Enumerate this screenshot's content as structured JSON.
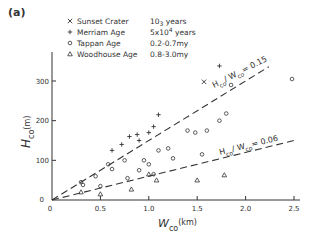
{
  "panel_label": "(a)",
  "legend": [
    {
      "symbol": "×",
      "name": "Sunset Crater",
      "age": "10",
      "age_sup": "3",
      "age_unit": "years"
    },
    {
      "symbol": "+",
      "name": "Merriam Age",
      "age": "5x10",
      "age_sup": "4",
      "age_unit": "years"
    },
    {
      "symbol": "○",
      "name": "Tappan Age",
      "age": "0.2-0.7my",
      "age_sup": "",
      "age_unit": ""
    },
    {
      "symbol": "△",
      "name": "Woodhouse Age",
      "age": "0.8-3.0my",
      "age_sup": "",
      "age_unit": ""
    }
  ],
  "axes": {
    "xlabel_main": "W",
    "xlabel_sub": "co",
    "xlabel_unit": "(km)",
    "ylabel_main": "H",
    "ylabel_sub": "co",
    "ylabel_unit": "(m)",
    "xticks": [
      "0",
      "0.5",
      "1.0",
      "1.5",
      "2.0",
      "2.5"
    ],
    "yticks": [
      "0",
      "100",
      "200",
      "300"
    ]
  },
  "lines": [
    {
      "label_main": "H",
      "label_sub": "co",
      "label_rest": "/ W",
      "label_sub2": "co",
      "label_eq": "= 0.15"
    },
    {
      "label_main": "H",
      "label_sub": "co",
      "label_rest": "/ W",
      "label_sub2": "co",
      "label_eq": "= 0.06"
    }
  ],
  "chart_data": {
    "type": "scatter",
    "title": "(a)",
    "xlabel": "W_co (km)",
    "ylabel": "H_co (m)",
    "xlim": [
      0,
      2.5
    ],
    "ylim": [
      0,
      350
    ],
    "grid": false,
    "legend_position": "upper left",
    "series": [
      {
        "name": "Sunset Crater 10^3 years",
        "marker": "x",
        "points": [
          [
            1.57,
            298
          ]
        ]
      },
      {
        "name": "Merriam Age 5x10^4 years",
        "marker": "+",
        "points": [
          [
            0.62,
            125
          ],
          [
            0.72,
            140
          ],
          [
            0.8,
            160
          ],
          [
            0.88,
            165
          ],
          [
            0.9,
            150
          ],
          [
            1.0,
            170
          ],
          [
            1.05,
            185
          ],
          [
            1.1,
            215
          ],
          [
            1.73,
            338
          ]
        ]
      },
      {
        "name": "Tappan Age 0.2-0.7my",
        "marker": "o",
        "points": [
          [
            0.3,
            45
          ],
          [
            0.32,
            38
          ],
          [
            0.45,
            60
          ],
          [
            0.5,
            35
          ],
          [
            0.58,
            90
          ],
          [
            0.62,
            78
          ],
          [
            0.75,
            100
          ],
          [
            0.78,
            55
          ],
          [
            0.9,
            75
          ],
          [
            0.95,
            100
          ],
          [
            1.0,
            90
          ],
          [
            1.05,
            65
          ],
          [
            1.1,
            125
          ],
          [
            1.2,
            130
          ],
          [
            1.25,
            105
          ],
          [
            1.4,
            175
          ],
          [
            1.48,
            170
          ],
          [
            1.55,
            115
          ],
          [
            1.6,
            175
          ],
          [
            1.73,
            200
          ],
          [
            1.8,
            218
          ],
          [
            1.85,
            290
          ],
          [
            2.48,
            305
          ]
        ]
      },
      {
        "name": "Woodhouse Age 0.8-3.0my",
        "marker": "^",
        "points": [
          [
            0.3,
            20
          ],
          [
            0.5,
            15
          ],
          [
            0.82,
            27
          ],
          [
            1.0,
            65
          ],
          [
            1.08,
            50
          ],
          [
            1.5,
            50
          ],
          [
            1.78,
            63
          ]
        ]
      }
    ],
    "reference_lines": [
      {
        "label": "H_co / W_co = 0.15",
        "slope_m_per_km": 150,
        "style": "dashed"
      },
      {
        "label": "H_co / W_co = 0.06",
        "slope_m_per_km": 60,
        "style": "dashed"
      }
    ]
  }
}
